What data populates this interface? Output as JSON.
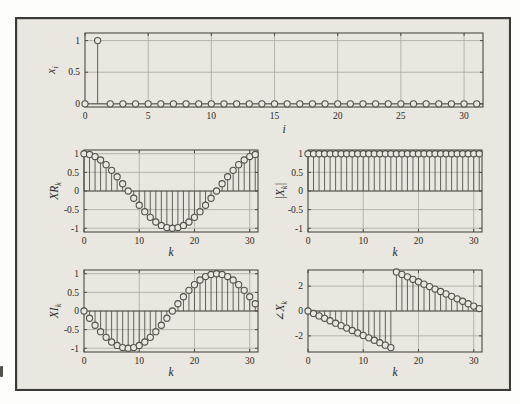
{
  "figure": {
    "panel_bg": "#e9e7e0",
    "border_color": "#3b3a34",
    "axis_color": "#4c4b43",
    "grid_color": "#a8a79b",
    "stem_color": "#52514a",
    "text_color": "#28281f",
    "tick_font_px": 9.5,
    "label_font_px": 11.5
  },
  "chart_data": [
    {
      "id": "input-sequence",
      "type": "stem",
      "title": "",
      "xlabel": "i",
      "ylabel_parts": [
        {
          "t": "x"
        },
        {
          "s": "i"
        }
      ],
      "x_start": 0,
      "values": [
        0,
        1,
        0,
        0,
        0,
        0,
        0,
        0,
        0,
        0,
        0,
        0,
        0,
        0,
        0,
        0,
        0,
        0,
        0,
        0,
        0,
        0,
        0,
        0,
        0,
        0,
        0,
        0,
        0,
        0,
        0,
        0
      ],
      "xlim": [
        0,
        31.5
      ],
      "ylim": [
        -0.05,
        1.12
      ],
      "xticks": [
        0,
        5,
        10,
        15,
        20,
        25,
        30
      ],
      "yticks": [
        0,
        0.5,
        1
      ],
      "grid": true,
      "box": {
        "left": 68,
        "top": 14,
        "width": 398,
        "height": 74
      },
      "ylabel_dx": -34,
      "xlabel_dy": 15
    },
    {
      "id": "dft-real-part",
      "type": "stem",
      "title": "",
      "xlabel": "k",
      "ylabel_parts": [
        {
          "t": "XR"
        },
        {
          "s": "k"
        }
      ],
      "x_start": 0,
      "values": [
        1,
        0.9808,
        0.9239,
        0.8315,
        0.7071,
        0.5556,
        0.3827,
        0.1951,
        0,
        -0.1951,
        -0.3827,
        -0.5556,
        -0.7071,
        -0.8315,
        -0.9239,
        -0.9808,
        -1,
        -0.9808,
        -0.9239,
        -0.8315,
        -0.7071,
        -0.5556,
        -0.3827,
        -0.1951,
        0,
        0.1951,
        0.3827,
        0.5556,
        0.7071,
        0.8315,
        0.9239,
        0.9808
      ],
      "xlim": [
        0,
        31.5
      ],
      "ylim": [
        -1.1,
        1.1
      ],
      "xticks": [
        0,
        10,
        20,
        30
      ],
      "yticks": [
        -1,
        -0.5,
        0,
        0.5,
        1
      ],
      "grid": true,
      "box": {
        "left": 67,
        "top": 131,
        "width": 174,
        "height": 82
      },
      "ylabel_dx": -30,
      "xlabel_dy": 13
    },
    {
      "id": "dft-magnitude",
      "type": "stem",
      "title": "",
      "xlabel": "k",
      "ylabel_parts": [
        {
          "t": "|X"
        },
        {
          "s": "k"
        },
        {
          "t": "|"
        }
      ],
      "x_start": 0,
      "values": [
        1,
        1,
        1,
        1,
        1,
        1,
        1,
        1,
        1,
        1,
        1,
        1,
        1,
        1,
        1,
        1,
        1,
        1,
        1,
        1,
        1,
        1,
        1,
        1,
        1,
        1,
        1,
        1,
        1,
        1,
        1,
        1
      ],
      "xlim": [
        0,
        31.5
      ],
      "ylim": [
        -1.1,
        1.1
      ],
      "xticks": [
        0,
        10,
        20,
        30
      ],
      "yticks": [
        -1,
        -0.5,
        0,
        0.5,
        1
      ],
      "grid": true,
      "box": {
        "left": 291,
        "top": 131,
        "width": 174,
        "height": 82
      },
      "ylabel_dx": -28,
      "xlabel_dy": 13
    },
    {
      "id": "dft-imag-part",
      "type": "stem",
      "title": "",
      "xlabel": "k",
      "ylabel_parts": [
        {
          "t": "XI"
        },
        {
          "s": "k"
        }
      ],
      "x_start": 0,
      "values": [
        0,
        -0.1951,
        -0.3827,
        -0.5556,
        -0.7071,
        -0.8315,
        -0.9239,
        -0.9808,
        -1,
        -0.9808,
        -0.9239,
        -0.8315,
        -0.7071,
        -0.5556,
        -0.3827,
        -0.1951,
        0,
        0.1951,
        0.3827,
        0.5556,
        0.7071,
        0.8315,
        0.9239,
        0.9808,
        1,
        0.9808,
        0.9239,
        0.8315,
        0.7071,
        0.5556,
        0.3827,
        0.1951
      ],
      "xlim": [
        0,
        31.5
      ],
      "ylim": [
        -1.1,
        1.1
      ],
      "xticks": [
        0,
        10,
        20,
        30
      ],
      "yticks": [
        -1,
        -0.5,
        0,
        0.5,
        1
      ],
      "grid": true,
      "box": {
        "left": 67,
        "top": 251,
        "width": 174,
        "height": 82
      },
      "ylabel_dx": -30,
      "xlabel_dy": 13
    },
    {
      "id": "dft-phase",
      "type": "stem",
      "title": "",
      "xlabel": "k",
      "ylabel_parts": [
        {
          "t": "∠X"
        },
        {
          "s": "k"
        }
      ],
      "x_start": 0,
      "values": [
        0,
        -0.1963,
        -0.3927,
        -0.589,
        -0.7854,
        -0.9817,
        -1.1781,
        -1.3744,
        -1.5708,
        -1.7671,
        -1.9635,
        -2.1598,
        -2.3562,
        -2.5525,
        -2.7489,
        -2.9452,
        3.1416,
        2.9452,
        2.7489,
        2.5525,
        2.3562,
        2.1598,
        1.9635,
        1.7671,
        1.5708,
        1.3744,
        1.1781,
        0.9817,
        0.7854,
        0.589,
        0.3927,
        0.1963
      ],
      "xlim": [
        0,
        31.5
      ],
      "ylim": [
        -3.3,
        3.3
      ],
      "xticks": [
        0,
        10,
        20,
        30
      ],
      "yticks": [
        -2,
        0,
        2
      ],
      "grid": true,
      "box": {
        "left": 291,
        "top": 251,
        "width": 174,
        "height": 82
      },
      "ylabel_dx": -28,
      "xlabel_dy": 13
    }
  ]
}
